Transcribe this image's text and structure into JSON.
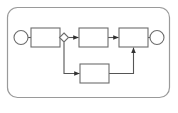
{
  "diagram": {
    "type": "process-flow",
    "title": "",
    "canvas": {
      "width": 178,
      "height": 113,
      "background": "#ffffff"
    },
    "pool": {
      "label": "",
      "x": 7.5,
      "y": 7.5,
      "width": 162,
      "height": 90,
      "corner_radius": 10,
      "stroke": "#9a9a9a",
      "stroke_width": 1.2,
      "fill": "#ffffff"
    },
    "style": {
      "node_stroke": "#6d6d6d",
      "node_fill": "#ffffff",
      "node_stroke_width": 1.1,
      "connector_stroke": "#555555",
      "connector_stroke_width": 1.1,
      "arrow_fill": "#333333"
    },
    "nodes": [
      {
        "id": "start-event",
        "shape": "circle",
        "label": "",
        "cx": 21,
        "cy": 37.5,
        "r": 7
      },
      {
        "id": "task-1",
        "shape": "rectangle",
        "label": "",
        "x": 31,
        "y": 28,
        "width": 29,
        "height": 19
      },
      {
        "id": "gateway-1",
        "shape": "diamond",
        "label": "",
        "cx": 64,
        "cy": 37.5,
        "rx": 4.5,
        "ry": 4.5
      },
      {
        "id": "task-2",
        "shape": "rectangle",
        "label": "",
        "x": 79,
        "y": 28,
        "width": 29,
        "height": 19
      },
      {
        "id": "task-3",
        "shape": "rectangle",
        "label": "",
        "x": 119,
        "y": 28,
        "width": 29,
        "height": 19
      },
      {
        "id": "end-event",
        "shape": "circle",
        "label": "",
        "cx": 157,
        "cy": 37.5,
        "r": 7
      },
      {
        "id": "task-4",
        "shape": "rectangle",
        "label": "",
        "x": 80,
        "y": 64,
        "width": 29,
        "height": 19
      }
    ],
    "connectors": [
      {
        "id": "start-to-task1",
        "from": "start-event",
        "to": "task-1",
        "label": "",
        "arrow": false,
        "points": "28,37.5 31,37.5"
      },
      {
        "id": "task1-to-gateway",
        "from": "task-1",
        "to": "gateway-1",
        "label": "",
        "arrow": false,
        "points": "60,37.5 59.5,37.5"
      },
      {
        "id": "gateway-to-task2",
        "from": "gateway-1",
        "to": "task-2",
        "label": "",
        "arrow": true,
        "points": "68.5,37.5 79,37.5"
      },
      {
        "id": "task2-to-task3",
        "from": "task-2",
        "to": "task-3",
        "label": "",
        "arrow": true,
        "points": "108,37.5 119,37.5"
      },
      {
        "id": "task3-to-end",
        "from": "task-3",
        "to": "end-event",
        "label": "",
        "arrow": false,
        "points": "148,37.5 150,37.5"
      },
      {
        "id": "gateway-to-task4",
        "from": "gateway-1",
        "to": "task-4",
        "label": "",
        "arrow": true,
        "points": "64,42 64,73.5 80,73.5"
      },
      {
        "id": "task4-to-task3",
        "from": "task-4",
        "to": "task-3",
        "label": "",
        "arrow": true,
        "points": "109,73.5 133.5,73.5 133.5,47"
      }
    ]
  }
}
